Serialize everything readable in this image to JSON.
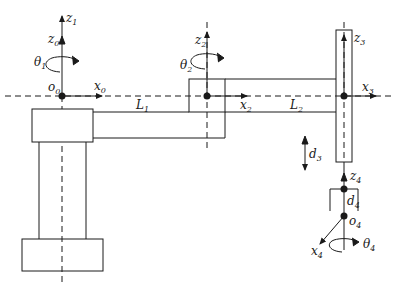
{
  "diagram": {
    "colors": {
      "stroke": "#1a1a1a",
      "background": "#ffffff"
    },
    "frames": [
      {
        "origin": "o",
        "origin_sub": "0",
        "z": "z",
        "z_sub": "0",
        "x": "x",
        "x_sub": "0"
      },
      {
        "z": "z",
        "z_sub": "1"
      },
      {
        "z": "z",
        "z_sub": "2",
        "x": "x",
        "x_sub": "2"
      },
      {
        "z": "z",
        "z_sub": "3",
        "x": "x",
        "x_sub": "3"
      },
      {
        "origin": "o",
        "origin_sub": "4",
        "z": "z",
        "z_sub": "4",
        "x": "x",
        "x_sub": "4"
      }
    ],
    "joints": [
      {
        "var": "θ",
        "sub": "1",
        "type": "revolute"
      },
      {
        "var": "θ",
        "sub": "2",
        "type": "revolute"
      },
      {
        "var": "d",
        "sub": "3",
        "type": "prismatic"
      },
      {
        "var": "θ",
        "sub": "4",
        "type": "revolute"
      }
    ],
    "links": [
      {
        "name": "L",
        "sub": "1"
      },
      {
        "name": "L",
        "sub": "2"
      }
    ],
    "offsets": [
      {
        "name": "d",
        "sub": "4"
      }
    ]
  }
}
